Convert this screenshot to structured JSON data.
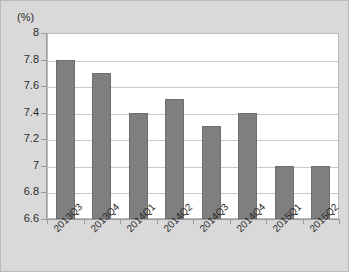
{
  "chart_data": {
    "type": "bar",
    "title": "",
    "subtitle": "",
    "xlabel": "",
    "ylabel": "(%)",
    "unit_label": "(%)",
    "categories": [
      "2013Q3",
      "2013Q4",
      "2014Q1",
      "2014Q2",
      "2014Q3",
      "2014Q4",
      "2015Q1",
      "2015Q2"
    ],
    "values": [
      7.8,
      7.7,
      7.4,
      7.5,
      7.3,
      7.4,
      7.0,
      7.0
    ],
    "ylim": [
      6.6,
      8
    ],
    "ytick_labels": [
      "8",
      "7.8",
      "7.6",
      "7.4",
      "7.2",
      "7",
      "6.8",
      "6.6"
    ],
    "ytick_values": [
      8,
      7.8,
      7.6,
      7.4,
      7.2,
      7,
      6.8,
      6.6
    ],
    "grid": true,
    "legend": false,
    "legend_position": "none",
    "series": [
      {
        "name": "",
        "values": [
          7.8,
          7.7,
          7.4,
          7.5,
          7.3,
          7.4,
          7.0,
          7.0
        ]
      }
    ],
    "colors": {
      "bar_fill": "#7f7f7f",
      "bar_border": "#6f6f6f",
      "plot_background": "#ffffff",
      "figure_background": "#d9d9d9",
      "gridline": "#c9c9c9",
      "axis_line": "#9a9a9a",
      "text": "#2b2b2b"
    }
  }
}
